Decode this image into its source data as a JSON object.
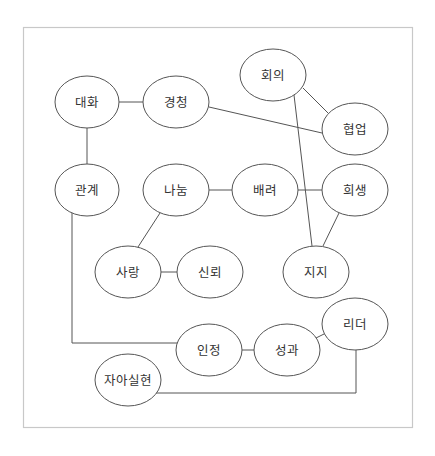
{
  "diagram": {
    "type": "concept-network",
    "frame": {
      "x": 23,
      "y": 27,
      "w": 389,
      "h": 400,
      "color": "#c8c8c8"
    },
    "line_color": "#555555",
    "nodes": [
      {
        "id": "daehwa",
        "label": "대화",
        "cx": 87,
        "cy": 102
      },
      {
        "id": "gyeongcheong",
        "label": "경청",
        "cx": 176,
        "cy": 102
      },
      {
        "id": "hoeui",
        "label": "회의",
        "cx": 273,
        "cy": 75
      },
      {
        "id": "hyeobeop",
        "label": "협업",
        "cx": 355,
        "cy": 129
      },
      {
        "id": "gwangye",
        "label": "관계",
        "cx": 87,
        "cy": 190
      },
      {
        "id": "nanum",
        "label": "나눔",
        "cx": 176,
        "cy": 190
      },
      {
        "id": "baeryeo",
        "label": "배려",
        "cx": 265,
        "cy": 190
      },
      {
        "id": "huisaeng",
        "label": "희생",
        "cx": 355,
        "cy": 190
      },
      {
        "id": "sarang",
        "label": "사랑",
        "cx": 128,
        "cy": 272
      },
      {
        "id": "sinroe",
        "label": "신뢰",
        "cx": 210,
        "cy": 272
      },
      {
        "id": "jiji",
        "label": "지지",
        "cx": 316,
        "cy": 272
      },
      {
        "id": "rideo",
        "label": "리더",
        "cx": 355,
        "cy": 324
      },
      {
        "id": "injeong",
        "label": "인정",
        "cx": 209,
        "cy": 350
      },
      {
        "id": "seonggwa",
        "label": "성과",
        "cx": 287,
        "cy": 350
      },
      {
        "id": "jaasilhyeon",
        "label": "자아실현",
        "cx": 128,
        "cy": 380
      }
    ],
    "edges": [
      {
        "from": "대화",
        "to": "경청"
      },
      {
        "from": "대화",
        "to": "관계"
      },
      {
        "from": "경청",
        "to": "협업"
      },
      {
        "from": "회의",
        "to": "협업"
      },
      {
        "from": "회의",
        "to": "지지"
      },
      {
        "from": "나눔",
        "to": "배려"
      },
      {
        "from": "배려",
        "to": "희생"
      },
      {
        "from": "희생",
        "to": "지지"
      },
      {
        "from": "나눔",
        "to": "사랑"
      },
      {
        "from": "사랑",
        "to": "신뢰"
      },
      {
        "from": "관계",
        "to": "인정",
        "routing": "orthogonal"
      },
      {
        "from": "인정",
        "to": "성과"
      },
      {
        "from": "성과",
        "to": "리더"
      },
      {
        "from": "자아실현",
        "to": "리더",
        "routing": "orthogonal"
      }
    ]
  }
}
